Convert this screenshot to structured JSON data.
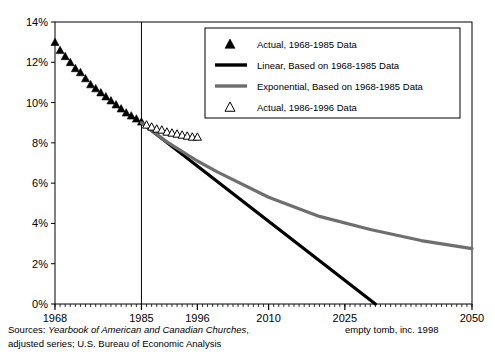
{
  "chart_data": {
    "type": "line",
    "title": "",
    "xlabel": "",
    "ylabel": "",
    "xlim": [
      1968,
      2050
    ],
    "ylim": [
      0,
      14
    ],
    "ytick_labels": [
      "0%",
      "2%",
      "4%",
      "6%",
      "8%",
      "10%",
      "12%",
      "14%"
    ],
    "ytick_values": [
      0,
      2,
      4,
      6,
      8,
      10,
      12,
      14
    ],
    "xtick_labels": [
      "1968",
      "1985",
      "1996",
      "2010",
      "2025",
      "2050"
    ],
    "xtick_values": [
      1968,
      1985,
      1996,
      2010,
      2025,
      2050
    ],
    "grid": false,
    "legend_position": "top-right",
    "vertical_reference_line": 1985,
    "series": [
      {
        "name": "Actual, 1968-1985 Data",
        "type": "scatter",
        "marker": "filled-triangle",
        "color": "#000000",
        "x": [
          1968,
          1969,
          1970,
          1971,
          1972,
          1973,
          1974,
          1975,
          1976,
          1977,
          1978,
          1979,
          1980,
          1981,
          1982,
          1983,
          1984,
          1985
        ],
        "values": [
          13.0,
          12.6,
          12.3,
          12.0,
          11.7,
          11.5,
          11.2,
          10.9,
          10.7,
          10.5,
          10.3,
          10.1,
          9.9,
          9.7,
          9.5,
          9.35,
          9.2,
          9.05
        ]
      },
      {
        "name": "Linear, Based on 1968-1985 Data",
        "type": "line",
        "color": "#000000",
        "x": [
          1985,
          2031
        ],
        "values": [
          9.0,
          0.0
        ]
      },
      {
        "name": "Exponential, Based on 1968-1985 Data",
        "type": "line",
        "color": "#6e6e6e",
        "x": [
          1985,
          1990,
          1996,
          2000,
          2010,
          2020,
          2030,
          2040,
          2050
        ],
        "values": [
          9.0,
          8.05,
          7.1,
          6.55,
          5.3,
          4.35,
          3.7,
          3.15,
          2.75
        ]
      },
      {
        "name": "Actual, 1986-1996 Data",
        "type": "scatter",
        "marker": "open-triangle",
        "color": "#000000",
        "x": [
          1986,
          1987,
          1988,
          1989,
          1990,
          1991,
          1992,
          1993,
          1994,
          1995,
          1996
        ],
        "values": [
          8.9,
          8.8,
          8.7,
          8.65,
          8.55,
          8.5,
          8.45,
          8.4,
          8.35,
          8.3,
          8.3
        ]
      }
    ]
  },
  "legend": {
    "items": [
      {
        "label": "Actual, 1968-1985 Data",
        "marker": "filled-triangle",
        "color": "#000000"
      },
      {
        "label": "Linear, Based on 1968-1985 Data",
        "marker": "thick-line",
        "color": "#000000"
      },
      {
        "label": "Exponential, Based on 1968-1985 Data",
        "marker": "thick-line",
        "color": "#6e6e6e"
      },
      {
        "label": "Actual, 1986-1996 Data",
        "marker": "open-triangle",
        "color": "#000000"
      }
    ]
  },
  "footer": {
    "sources_label": "Sources: ",
    "sources_italic": "Yearbook of American and Canadian Churches",
    "sources_rest": ",",
    "sources_line2": "adjusted series; U.S. Bureau of Economic Analysis",
    "credit": "empty tomb, inc. 1998"
  }
}
